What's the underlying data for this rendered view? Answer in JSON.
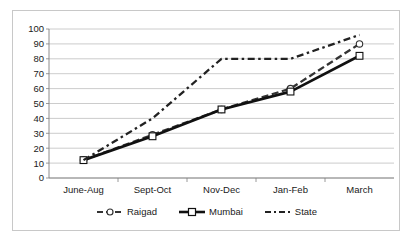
{
  "chart_data": {
    "type": "line",
    "title": "",
    "subtitle": "",
    "xlabel": "",
    "ylabel": "",
    "categories": [
      "June-Aug",
      "Sept-Oct",
      "Nov-Dec",
      "Jan-Feb",
      "March"
    ],
    "series": [
      {
        "name": "Raigad",
        "values": [
          12,
          29,
          46,
          60,
          90
        ],
        "marker": "circle",
        "line_style": "dashed",
        "color": "#333333"
      },
      {
        "name": "Mumbai",
        "values": [
          12,
          28,
          46,
          58,
          82
        ],
        "marker": "square",
        "line_style": "solid",
        "color": "#111111"
      },
      {
        "name": "State",
        "values": [
          12,
          40,
          80,
          80,
          96
        ],
        "marker": "none",
        "line_style": "dashed",
        "color": "#222222"
      }
    ],
    "ylim": [
      0,
      100
    ],
    "yticks": [
      0,
      10,
      20,
      30,
      40,
      50,
      60,
      70,
      80,
      90,
      100
    ],
    "ytick_labels": [
      "0",
      "10",
      "20",
      "30",
      "40",
      "50",
      "60",
      "70",
      "80",
      "90",
      "100"
    ],
    "grid": true,
    "grid_axis": "y",
    "grid_color": "#bfbfbf",
    "legend_position": "bottom",
    "axis_color": "#808080",
    "plot_background": "#ffffff",
    "border_color": "#c8c8c8"
  },
  "legend": {
    "items": [
      {
        "label": "Raigad"
      },
      {
        "label": "Mumbai"
      },
      {
        "label": "State"
      }
    ]
  }
}
